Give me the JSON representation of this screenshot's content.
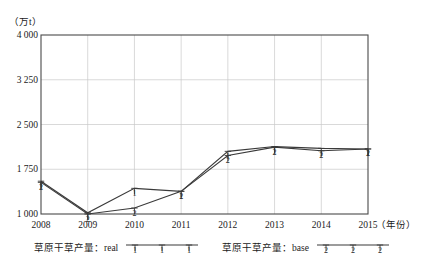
{
  "chart_data": {
    "type": "line",
    "title": "",
    "subtitle": "",
    "unit_label": "（万t）",
    "xlabel": "（年份）",
    "ylabel": "",
    "x": [
      "2008",
      "2009",
      "2010",
      "2011",
      "2012",
      "2013",
      "2014",
      "2015"
    ],
    "categories": [
      "2008",
      "2009",
      "2010",
      "2011",
      "2012",
      "2013",
      "2014",
      "2015"
    ],
    "yticks": [
      "1 000",
      "1 750",
      "2 500",
      "3 250",
      "4 000"
    ],
    "ytick_values": [
      1000,
      1750,
      2500,
      3250,
      4000
    ],
    "ylim": [
      1000,
      4000
    ],
    "grid": true,
    "legend_position": "below-axis",
    "series": [
      {
        "name": "草原干草产量：real",
        "marker": "1",
        "values": [
          1550,
          1020,
          1430,
          1380,
          2050,
          2130,
          2100,
          2090
        ]
      },
      {
        "name": "草原干草产量：base",
        "marker": "2",
        "values": [
          1530,
          1000,
          1100,
          1380,
          1980,
          2120,
          2060,
          2090
        ]
      }
    ],
    "colors": {
      "series_line": "#3a3a3a",
      "grid": "#c9c9c9",
      "frame": "#4a4a4a"
    }
  },
  "legend": {
    "entries": [
      {
        "label": "草原干草产量：real",
        "marker": "1"
      },
      {
        "label": "草原干草产量：base",
        "marker": "2"
      }
    ]
  },
  "axes": {
    "x_title": "（年份）",
    "y_unit": "（万t）"
  }
}
